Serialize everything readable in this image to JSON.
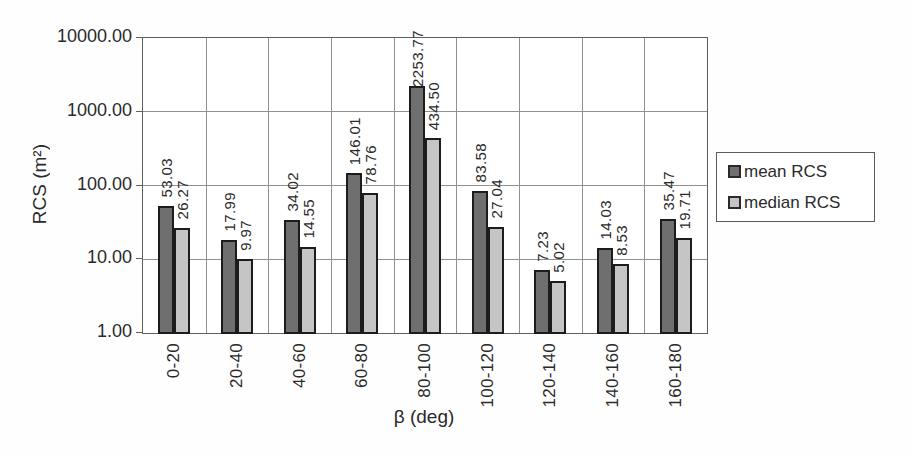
{
  "chart_data": {
    "type": "bar",
    "title": "",
    "xlabel": "β (deg)",
    "ylabel": "RCS (m²)",
    "y_scale": "log",
    "ylim": [
      1,
      10000
    ],
    "y_tick_labels": [
      "10000.00",
      "1000.00",
      "100.00",
      "10.00",
      "1.00"
    ],
    "categories": [
      "0-20",
      "20-40",
      "40-60",
      "60-80",
      "80-100",
      "100-120",
      "120-140",
      "140-160",
      "160-180"
    ],
    "series": [
      {
        "name": "mean RCS",
        "color": "#6f6f6f",
        "values": [
          53.03,
          17.99,
          34.02,
          146.01,
          2253.77,
          83.58,
          7.23,
          14.03,
          35.47
        ]
      },
      {
        "name": "median RCS",
        "color": "#c5c5c5",
        "values": [
          26.27,
          9.97,
          14.55,
          78.76,
          434.5,
          27.04,
          5.02,
          8.53,
          19.71
        ]
      }
    ],
    "value_label_format": "0.00",
    "grid": "major-horizontal-and-vertical",
    "legend_position": "right-middle"
  },
  "colors": {
    "mean_bar": "#6f6f6f",
    "median_bar": "#c5c5c5",
    "bar_border": "#1c1c1c",
    "gridline": "#909090",
    "frame": "#5f5f5f",
    "text": "#2a2a2a",
    "background": "#ffffff"
  }
}
